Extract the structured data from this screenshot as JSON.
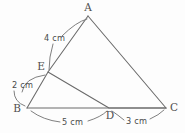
{
  "figure": {
    "type": "geometry-diagram",
    "background_color": "#fdfdfd",
    "line_color": "#6a6a6a",
    "text_color": "#4a4a4a",
    "vertices": [
      {
        "id": "A",
        "label": "A",
        "x": 88,
        "y": 16,
        "label_x": 88,
        "label_y": 11
      },
      {
        "id": "B",
        "label": "B",
        "x": 27,
        "y": 108,
        "label_x": 17,
        "label_y": 112
      },
      {
        "id": "C",
        "label": "C",
        "x": 166,
        "y": 108,
        "label_x": 174,
        "label_y": 111
      },
      {
        "id": "D",
        "label": "D",
        "x": 109,
        "y": 108,
        "label_x": 110,
        "label_y": 119
      },
      {
        "id": "E",
        "label": "E",
        "x": 48,
        "y": 72,
        "label_x": 41,
        "label_y": 70
      }
    ],
    "segments": [
      {
        "id": "AB",
        "from": "A",
        "to": "B",
        "note": "passes through E"
      },
      {
        "id": "AC",
        "from": "A",
        "to": "C"
      },
      {
        "id": "BC",
        "from": "B",
        "to": "C",
        "note": "passes through D"
      },
      {
        "id": "EC",
        "from": "E",
        "to": "C",
        "note": "passes through D"
      }
    ],
    "measurements": [
      {
        "id": "AE",
        "label": "4 cm",
        "value": 4,
        "unit": "cm",
        "segment": "A-E",
        "x": 44,
        "y": 41
      },
      {
        "id": "EB",
        "label": "2 cm",
        "value": 2,
        "unit": "cm",
        "segment": "E-B",
        "x": 12,
        "y": 88
      },
      {
        "id": "BD",
        "label": "5 cm",
        "value": 5,
        "unit": "cm",
        "segment": "B-D",
        "x": 62,
        "y": 125
      },
      {
        "id": "DC",
        "label": "3 cm",
        "value": 3,
        "unit": "cm",
        "segment": "D-C",
        "x": 126,
        "y": 124
      }
    ]
  }
}
